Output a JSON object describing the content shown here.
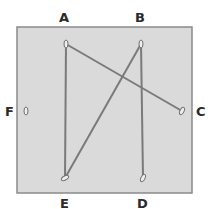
{
  "diagram": {
    "box": {
      "x": 17,
      "y": 27,
      "width": 175,
      "height": 166,
      "fill": "#dadada",
      "stroke": "#8a8a8a"
    },
    "line_color": "#7a7a7a",
    "points": [
      {
        "id": "A",
        "x": 66,
        "y": 44,
        "label": "A",
        "label_x": 59,
        "label_y": 11
      },
      {
        "id": "B",
        "x": 141,
        "y": 44,
        "label": "B",
        "label_x": 135,
        "label_y": 11
      },
      {
        "id": "C",
        "x": 182,
        "y": 111,
        "label": "C",
        "label_x": 196,
        "label_y": 105
      },
      {
        "id": "D",
        "x": 143,
        "y": 178,
        "label": "D",
        "label_x": 137,
        "label_y": 197
      },
      {
        "id": "E",
        "x": 65,
        "y": 178,
        "label": "E",
        "label_x": 60,
        "label_y": 197
      },
      {
        "id": "F",
        "x": 26,
        "y": 111,
        "label": "F",
        "label_x": 5,
        "label_y": 105
      }
    ],
    "connections": [
      {
        "from": "A",
        "to": "E"
      },
      {
        "from": "A",
        "to": "C"
      },
      {
        "from": "B",
        "to": "D"
      },
      {
        "from": "B",
        "to": "E"
      }
    ]
  }
}
